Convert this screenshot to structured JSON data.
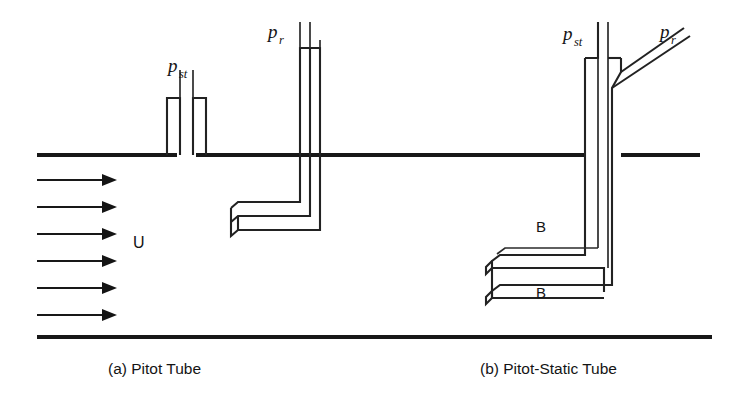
{
  "figure": {
    "background_color": "#ffffff",
    "ink_color": "#181818",
    "width": 732,
    "height": 401
  },
  "walls": {
    "upper_wall_label": "upper-channel-wall",
    "lower_wall_label": "lower-channel-wall",
    "upper_y": 155,
    "lower_y": 337,
    "upper_x_start": 37,
    "upper_x_end": 700,
    "lower_x_start": 37,
    "lower_x_end": 712
  },
  "flow": {
    "velocity_label": "U",
    "arrow_count": 6,
    "arrow_x_start": 37,
    "arrow_x_end": 115,
    "arrow_ys": [
      180,
      207,
      234,
      261,
      288,
      315
    ],
    "label_x": 133,
    "label_y": 248
  },
  "panels": [
    {
      "id": "panel-a",
      "caption": "(a) Pitot Tube",
      "caption_x": 108,
      "caption_y": 374,
      "probes": [
        {
          "id": "static-tap",
          "label_main": "p",
          "label_sub": "st",
          "label_x": 168,
          "label_y": 72,
          "type": "open-static-tap"
        },
        {
          "id": "pitot-total",
          "label_main": "p",
          "label_sub": "r",
          "label_x": 268,
          "label_y": 38,
          "type": "bent-l-tube"
        }
      ]
    },
    {
      "id": "panel-b",
      "caption": "(b) Pitot-Static Tube",
      "caption_x": 480,
      "caption_y": 374,
      "probes": [
        {
          "id": "static-stem",
          "label_main": "p",
          "label_sub": "st",
          "label_x": 563,
          "label_y": 40,
          "type": "vertical-stem"
        },
        {
          "id": "total-branch",
          "label_main": "p",
          "label_sub": "r",
          "label_x": 660,
          "label_y": 38,
          "type": "diagonal-branch"
        }
      ],
      "port_labels": [
        {
          "text": "B",
          "x": 536,
          "y": 232,
          "name": "static-port-label-upper"
        },
        {
          "text": "B",
          "x": 536,
          "y": 298,
          "name": "static-port-label-lower"
        }
      ]
    }
  ]
}
